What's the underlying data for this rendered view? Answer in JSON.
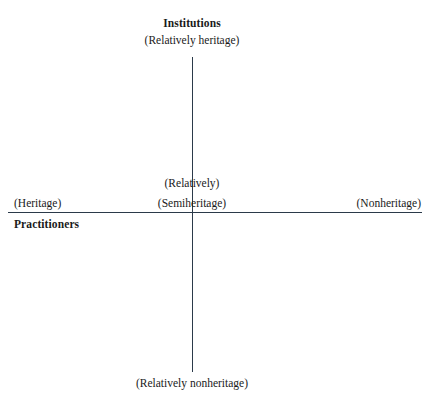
{
  "figure": {
    "background_color": "#ffffff",
    "axis_color": "#2b3a4a",
    "text_color": "#1a1a1a"
  },
  "axes": {
    "vertical_name": "vertical-axis",
    "horizontal_name": "horizontal-axis"
  },
  "poles": {
    "top": {
      "title": "Institutions",
      "subtitle": "(Relatively heritage)"
    },
    "bottom": {
      "subtitle": "(Relatively nonheritage)"
    },
    "left": {
      "title": "Practitioners",
      "subtitle": "(Heritage)"
    },
    "right": {
      "subtitle": "(Nonheritage)"
    },
    "center": {
      "line1": "(Relatively)",
      "line2": "(Semiheritage)"
    }
  },
  "chart_data": {
    "type": "scatter",
    "title": "",
    "xlabel": "Practitioners",
    "ylabel": "Institutions",
    "x_axis_labels": [
      "(Heritage)",
      "(Semiheritage)",
      "(Nonheritage)"
    ],
    "y_axis_labels": [
      "(Relatively heritage)",
      "(Relatively)",
      "(Relatively nonheritage)"
    ],
    "x": [],
    "y": [],
    "grid": false,
    "legend": "none",
    "annotations": [
      "Institutions",
      "(Relatively heritage)",
      "(Heritage)",
      "Practitioners",
      "(Relatively)",
      "(Semiheritage)",
      "(Nonheritage)",
      "(Relatively nonheritage)"
    ]
  }
}
